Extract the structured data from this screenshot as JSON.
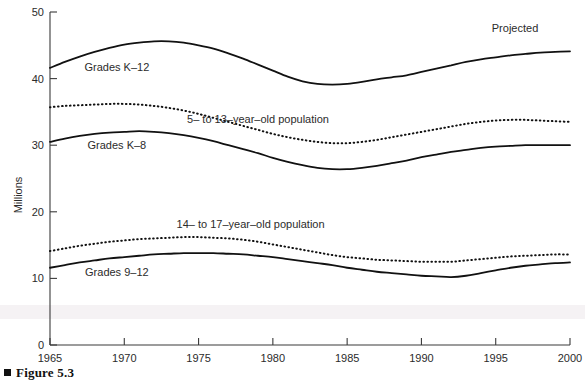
{
  "figure": {
    "caption": "Figure 5.3",
    "caption_marker": "square-bullet"
  },
  "chart_data": {
    "type": "line",
    "title": "",
    "xlabel": "",
    "ylabel": "Millions",
    "xlim": [
      1965,
      2000
    ],
    "ylim": [
      0,
      50
    ],
    "grid": false,
    "legend_position": "inline-annotations",
    "x_ticks": [
      "1965",
      "1970",
      "1975",
      "1980",
      "1985",
      "1990",
      "1995",
      "2000"
    ],
    "y_ticks": [
      "0",
      "10",
      "20",
      "30",
      "40",
      "50"
    ],
    "x": [
      1965,
      1966,
      1967,
      1968,
      1969,
      1970,
      1971,
      1972,
      1973,
      1974,
      1975,
      1976,
      1977,
      1978,
      1979,
      1980,
      1981,
      1982,
      1983,
      1984,
      1985,
      1986,
      1987,
      1988,
      1989,
      1990,
      1991,
      1992,
      1993,
      1994,
      1995,
      1996,
      1997,
      1998,
      1999,
      2000
    ],
    "series": [
      {
        "name": "Grades K–12",
        "style": "solid",
        "label": "Grades K–12",
        "values": [
          41.6,
          42.5,
          43.3,
          44.0,
          44.6,
          45.1,
          45.4,
          45.6,
          45.6,
          45.4,
          45.0,
          44.5,
          43.8,
          43.0,
          42.1,
          41.2,
          40.3,
          39.6,
          39.2,
          39.1,
          39.2,
          39.5,
          39.9,
          40.2,
          40.5,
          41.0,
          41.5,
          42.0,
          42.5,
          42.9,
          43.2,
          43.5,
          43.7,
          43.9,
          44.0,
          44.1
        ]
      },
      {
        "name": "5– to 13–year–old population",
        "style": "dotted",
        "label": "5– to 13–year–old population",
        "values": [
          35.7,
          35.9,
          36.0,
          36.1,
          36.2,
          36.2,
          36.1,
          35.9,
          35.6,
          35.2,
          34.7,
          34.1,
          33.5,
          32.9,
          32.3,
          31.7,
          31.2,
          30.8,
          30.5,
          30.3,
          30.3,
          30.5,
          30.8,
          31.2,
          31.6,
          32.0,
          32.4,
          32.8,
          33.2,
          33.5,
          33.7,
          33.8,
          33.8,
          33.7,
          33.6,
          33.5
        ]
      },
      {
        "name": "Grades K–8",
        "style": "solid",
        "label": "Grades K–8",
        "values": [
          30.5,
          31.0,
          31.4,
          31.7,
          31.9,
          32.0,
          32.1,
          32.0,
          31.8,
          31.5,
          31.1,
          30.6,
          30.0,
          29.4,
          28.8,
          28.1,
          27.5,
          27.0,
          26.6,
          26.4,
          26.4,
          26.6,
          26.9,
          27.3,
          27.7,
          28.2,
          28.6,
          29.0,
          29.3,
          29.6,
          29.8,
          29.9,
          30.0,
          30.0,
          30.0,
          30.0
        ]
      },
      {
        "name": "14– to 17–year–old population",
        "style": "dotted",
        "label": "14– to 17–year–old population",
        "values": [
          14.1,
          14.5,
          14.9,
          15.2,
          15.5,
          15.7,
          15.9,
          16.0,
          16.1,
          16.2,
          16.2,
          16.1,
          16.0,
          15.8,
          15.5,
          15.1,
          14.7,
          14.3,
          13.9,
          13.5,
          13.2,
          13.0,
          12.8,
          12.7,
          12.6,
          12.5,
          12.5,
          12.5,
          12.7,
          12.9,
          13.1,
          13.3,
          13.4,
          13.5,
          13.6,
          13.6
        ]
      },
      {
        "name": "Grades 9–12",
        "style": "solid",
        "label": "Grades 9–12",
        "values": [
          11.6,
          12.0,
          12.4,
          12.7,
          13.0,
          13.2,
          13.4,
          13.6,
          13.7,
          13.8,
          13.8,
          13.8,
          13.7,
          13.6,
          13.4,
          13.2,
          12.9,
          12.6,
          12.3,
          12.0,
          11.6,
          11.3,
          11.0,
          10.8,
          10.6,
          10.4,
          10.3,
          10.2,
          10.4,
          10.8,
          11.2,
          11.6,
          11.9,
          12.1,
          12.3,
          12.4
        ]
      }
    ],
    "annotations": [
      {
        "text": "Projected",
        "x": 1996.3,
        "y": 47.0
      },
      {
        "text": "Grades K–12",
        "x": 1969.5,
        "y": 41.2
      },
      {
        "text": "5– to 13–year–old population",
        "x": 1979.0,
        "y": 33.4
      },
      {
        "text": "Grades K–8",
        "x": 1969.5,
        "y": 29.5
      },
      {
        "text": "14– to 17–year–old population",
        "x": 1978.5,
        "y": 17.6
      },
      {
        "text": "Grades 9–12",
        "x": 1969.5,
        "y": 10.3
      }
    ]
  }
}
